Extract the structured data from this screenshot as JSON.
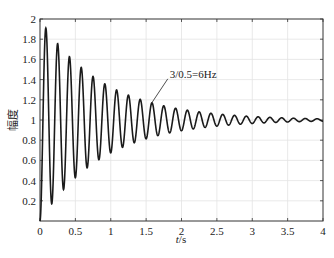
{
  "chart_data": {
    "type": "line",
    "title": "",
    "xlabel": "t/s",
    "xlabel_italic_part": "t",
    "xlabel_unit_part": "/s",
    "ylabel": "幅度",
    "xlim": [
      0,
      4
    ],
    "ylim": [
      0,
      2
    ],
    "xticks": [
      0,
      0.5,
      1,
      1.5,
      2,
      2.5,
      3,
      3.5,
      4
    ],
    "xtick_labels": [
      "0",
      "0.5",
      "1",
      "1.5",
      "2",
      "2.5",
      "3",
      "3.5",
      "4"
    ],
    "yticks": [
      0.2,
      0.4,
      0.6,
      0.8,
      1,
      1.2,
      1.4,
      1.6,
      1.8,
      2
    ],
    "ytick_labels": [
      "0.2",
      "0.4",
      "0.6",
      "0.8",
      "1",
      "1.2",
      "1.4",
      "1.6",
      "1.8",
      "2"
    ],
    "grid": true,
    "legend": null,
    "series": [
      {
        "name": "step response",
        "color": "#1a1a1a",
        "description": "Damped oscillation settling to 1, oscillation frequency ~6 Hz",
        "model": {
          "final_value": 1,
          "freq_hz": 6,
          "decay_rate": 1.12
        },
        "peaks": [
          {
            "t": 0.08,
            "y": 1.9
          },
          {
            "t": 0.25,
            "y": 1.75
          },
          {
            "t": 0.42,
            "y": 1.62
          },
          {
            "t": 0.58,
            "y": 1.51
          },
          {
            "t": 0.75,
            "y": 1.42
          },
          {
            "t": 0.92,
            "y": 1.35
          },
          {
            "t": 1.08,
            "y": 1.29
          },
          {
            "t": 1.25,
            "y": 1.24
          },
          {
            "t": 1.42,
            "y": 1.2
          },
          {
            "t": 1.58,
            "y": 1.17
          },
          {
            "t": 2.0,
            "y": 1.1
          },
          {
            "t": 2.5,
            "y": 1.06
          },
          {
            "t": 3.0,
            "y": 1.04
          },
          {
            "t": 3.5,
            "y": 1.02
          },
          {
            "t": 4.0,
            "y": 1.01
          }
        ],
        "troughs": [
          {
            "t": 0.17,
            "y": 0.18
          },
          {
            "t": 0.33,
            "y": 0.32
          },
          {
            "t": 0.5,
            "y": 0.44
          },
          {
            "t": 0.67,
            "y": 0.54
          },
          {
            "t": 0.83,
            "y": 0.62
          },
          {
            "t": 1.0,
            "y": 0.68
          },
          {
            "t": 1.17,
            "y": 0.74
          },
          {
            "t": 1.33,
            "y": 0.78
          },
          {
            "t": 1.5,
            "y": 0.82
          },
          {
            "t": 1.67,
            "y": 0.85
          }
        ]
      }
    ],
    "annotations": [
      {
        "text": "3/0.5=6Hz",
        "arrow_to": {
          "t": 1.58,
          "y": 1.17
        }
      }
    ]
  }
}
